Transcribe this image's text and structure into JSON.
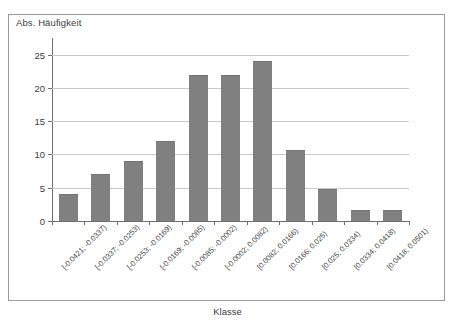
{
  "chart_data": {
    "type": "bar",
    "title": "",
    "ylabel": "Abs. Häufigkeit",
    "xlabel": "Klasse",
    "ylim": [
      0,
      27.5
    ],
    "yticks": [
      0,
      5,
      10,
      15,
      20,
      25
    ],
    "grid": true,
    "legend": false,
    "bar_color": "#808080",
    "categories": [
      "[-0.0421; -0.0337)",
      "[-0.0337; -0.0253)",
      "[-0.0253; -0.0169)",
      "[-0.0169; -0.0085)",
      "[-0.0085; -0.0002)",
      "[-0.0002; 0.0082)",
      "[0.0082; 0.0166)",
      "[0.0166; 0.025)",
      "[0.025; 0.0334)",
      "[0.0334; 0.0418)",
      "[0.0418; 0.0501)"
    ],
    "values": [
      4,
      7,
      9,
      12,
      22,
      22,
      24,
      10.7,
      4.8,
      1.7,
      1.6
    ]
  },
  "axis": {
    "y_title": "Abs. Häufigkeit",
    "x_title": "Klasse",
    "y_tick_labels": [
      "25",
      "20",
      "15",
      "10",
      "5",
      "0"
    ]
  }
}
